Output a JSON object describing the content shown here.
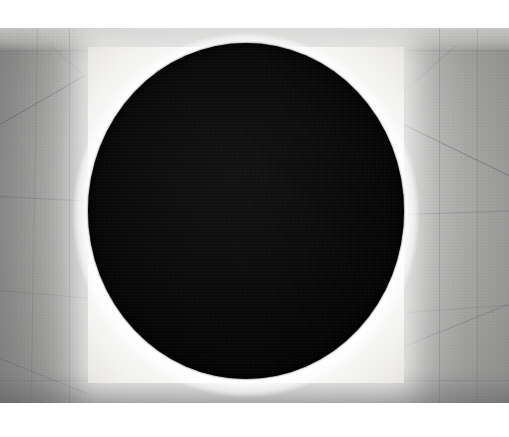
{
  "image": {
    "title": "Black Circle Installation",
    "subject": "large black circular disc on an illuminated white square panel in a concrete alcove",
    "medium": "black-and-white photograph",
    "dimensions": {
      "width": 509,
      "height": 437
    }
  },
  "layout": {
    "margin_top_px": 28,
    "margin_bottom_px": 34,
    "photo": {
      "x": 0,
      "y": 28,
      "width": 509,
      "height": 375
    }
  },
  "elements": {
    "wall": {
      "name": "concrete-wall",
      "description": "grey cast-concrete wall with visible panel seams converging in perspective",
      "color": "#a3a3a1"
    },
    "left_reveal": {
      "name": "left-splay",
      "description": "angled left reveal of the alcove, in shadow",
      "color": "#7d7d7f"
    },
    "right_reveal": {
      "name": "right-splay",
      "description": "angled right reveal of the alcove",
      "color": "#9a9a9a"
    },
    "light_panel": {
      "name": "illuminated-square-panel",
      "description": "backlit white square panel behind the disc",
      "color": "#ffffff",
      "bounds": {
        "x": 88,
        "y": 47,
        "width": 316,
        "height": 336
      }
    },
    "disc": {
      "name": "black-circle",
      "description": "matte black circular void filling the lit panel",
      "color": "#0a0a0a",
      "bounds": {
        "x": 88,
        "y": 43,
        "width": 316,
        "height": 336
      }
    }
  },
  "palette": {
    "white": "#ffffff",
    "panel_white": "#fbfbfb",
    "wall_light": "#d2d2d0",
    "wall_mid": "#a3a3a1",
    "wall_dark": "#828284",
    "seam": "#3c3c3e",
    "disc_black": "#0a0a0a"
  },
  "seams": [
    {
      "name": "wall-seam-left-upper-diagonal",
      "x": 0,
      "y": 96,
      "length": 96,
      "angle": -30,
      "thickness": 1,
      "weight": "normal"
    },
    {
      "name": "wall-seam-left-vertical-a",
      "x": 38,
      "y": 0,
      "length": 375,
      "angle": 91,
      "thickness": 1,
      "weight": "faint"
    },
    {
      "name": "wall-seam-left-vertical-b",
      "x": 70,
      "y": 0,
      "length": 375,
      "angle": 90,
      "thickness": 1,
      "weight": "soft"
    },
    {
      "name": "wall-seam-left-horizontal-a",
      "x": 0,
      "y": 168,
      "length": 90,
      "angle": 3,
      "thickness": 1,
      "weight": "soft"
    },
    {
      "name": "wall-seam-left-horizontal-b",
      "x": 0,
      "y": 262,
      "length": 90,
      "angle": 5,
      "thickness": 1,
      "weight": "faint"
    },
    {
      "name": "wall-seam-left-lower-diagonal",
      "x": 0,
      "y": 330,
      "length": 95,
      "angle": 22,
      "thickness": 1,
      "weight": "soft"
    },
    {
      "name": "wall-seam-top-horizontal",
      "x": 0,
      "y": 22,
      "length": 509,
      "angle": 0,
      "thickness": 1,
      "weight": "faint"
    },
    {
      "name": "wall-seam-right-diagonal-upper",
      "x": 404,
      "y": 96,
      "length": 118,
      "angle": 26,
      "thickness": 1,
      "weight": "normal"
    },
    {
      "name": "wall-seam-right-vertical-a",
      "x": 440,
      "y": 0,
      "length": 375,
      "angle": 90,
      "thickness": 1,
      "weight": "soft"
    },
    {
      "name": "wall-seam-right-vertical-b",
      "x": 478,
      "y": 0,
      "length": 375,
      "angle": 90,
      "thickness": 1,
      "weight": "faint"
    },
    {
      "name": "wall-seam-right-horizontal-a",
      "x": 406,
      "y": 186,
      "length": 103,
      "angle": -2,
      "thickness": 1,
      "weight": "soft"
    },
    {
      "name": "wall-seam-right-horizontal-b",
      "x": 406,
      "y": 284,
      "length": 103,
      "angle": -4,
      "thickness": 1,
      "weight": "faint"
    },
    {
      "name": "wall-seam-right-lower-diagonal",
      "x": 404,
      "y": 318,
      "length": 112,
      "angle": -22,
      "thickness": 1,
      "weight": "soft"
    },
    {
      "name": "wall-seam-bottom-horizontal",
      "x": 0,
      "y": 352,
      "length": 509,
      "angle": 0,
      "thickness": 1,
      "weight": "faint"
    },
    {
      "name": "wall-seam-top-left-corner-diagonal",
      "x": 52,
      "y": 18,
      "length": 70,
      "angle": 42,
      "thickness": 1,
      "weight": "faint"
    },
    {
      "name": "wall-seam-top-right-corner-diagonal",
      "x": 456,
      "y": 18,
      "length": 70,
      "angle": 138,
      "thickness": 1,
      "weight": "faint"
    }
  ]
}
